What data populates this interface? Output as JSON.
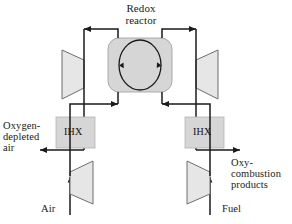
{
  "figure": {
    "name": "redox-reactor-chemical-looping-diagram",
    "background_color": "#ffffff",
    "line_color": "#1a1a1a",
    "shape_fill": "#d9d9d9",
    "shape_fill_light": "#e8e8e8",
    "shape_stroke": "#6e6e6e",
    "width": 292,
    "height": 224
  },
  "title": {
    "line1": "Redox",
    "line2": "reactor"
  },
  "labels": {
    "left_outlet": {
      "line1": "Oxygen-",
      "line2": "depleted",
      "line3": "air"
    },
    "right_outlet": {
      "line1": "Oxy-",
      "line2": "combustion",
      "line3": "products"
    },
    "left_inlet": "Air",
    "right_inlet": "Fuel"
  },
  "components": {
    "reactor": {
      "name": "Redox reactor",
      "inner": "oxygen carrier circulation loop"
    },
    "ihx_left": "IHX",
    "ihx_right": "IHX",
    "turbine_left": "turbine",
    "turbine_right": "turbine",
    "compressor_left": "compressor",
    "compressor_right": "compressor"
  }
}
